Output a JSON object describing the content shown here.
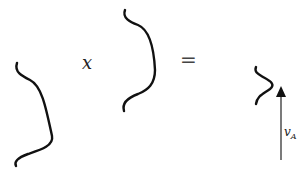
{
  "diagram": {
    "operator_times": "x",
    "operator_equals": "=",
    "arrow_label": "v",
    "arrow_label_sub": "A",
    "colors": {
      "stroke": "#111111",
      "text": "#333333",
      "background": "#ffffff"
    }
  }
}
